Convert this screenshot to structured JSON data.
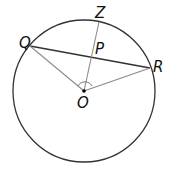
{
  "diagram": {
    "type": "circle-geometry",
    "circle": {
      "center_label": "O",
      "cx": 84,
      "cy": 91,
      "r": 71
    },
    "points": {
      "O": {
        "label": "O",
        "x": 84,
        "y": 91
      },
      "Q": {
        "label": "Q",
        "x": 30,
        "y": 46
      },
      "R": {
        "label": "R",
        "x": 150,
        "y": 68
      },
      "Z": {
        "label": "Z",
        "x": 99,
        "y": 22
      },
      "P": {
        "label": "P",
        "x": 91,
        "y": 57
      }
    },
    "segments": [
      "QR (chord)",
      "OQ",
      "OR",
      "OZ (through P)"
    ],
    "annotations": [
      "angle mark at O between OQ and OR"
    ],
    "colors": {
      "circle": "#333333",
      "chord": "#333333",
      "radii": "#888888"
    }
  }
}
